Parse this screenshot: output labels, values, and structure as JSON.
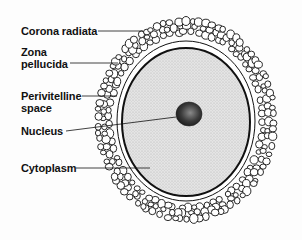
{
  "diagram": {
    "labels": [
      {
        "id": "corona-radiata",
        "text": "Corona radiata",
        "x": 21,
        "y": 25
      },
      {
        "id": "zona-pellucida",
        "text": "Zona\npellucida",
        "x": 21,
        "y": 47
      },
      {
        "id": "perivitelline-space",
        "text": "Perivitelline\nspace",
        "x": 21,
        "y": 90
      },
      {
        "id": "nucleus",
        "text": "Nucleus",
        "x": 21,
        "y": 126
      },
      {
        "id": "cytoplasm",
        "text": "Cytoplasm",
        "x": 21,
        "y": 162
      }
    ],
    "colors": {
      "line": "#111111",
      "cytoplasm_fill": "#dcdcdc",
      "nucleus_fill": "#444444",
      "background": "#fdfdfd"
    }
  }
}
